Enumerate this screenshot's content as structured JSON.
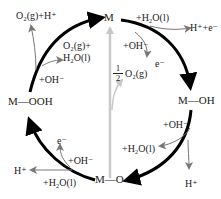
{
  "nodes": {
    "m": "M",
    "m_oh": "M—OH",
    "m_o": "M—O",
    "m_ooh": "M—OOH"
  },
  "center": {
    "fraction_num": "1",
    "fraction_den": "2",
    "species": "O₂(g)"
  },
  "steps": {
    "top_right": {
      "reactant_1": "+H₂O(l)",
      "reactant_2": "+OH⁻",
      "product_1": "H⁺+e⁻",
      "product_2": "e⁻"
    },
    "right": {
      "reactant_1": "+OH⁻",
      "reactant_2": "+H₂O(l)",
      "product_1": "H⁺"
    },
    "bottom_left": {
      "reactant_1": "+OH⁻",
      "reactant_2": "+H₂O(l)",
      "product_1": "e⁻",
      "product_2": "H⁺"
    },
    "top_left": {
      "reactant_1": "+OH⁻",
      "product_1": "O₂(g)+",
      "product_1b": "H₂O(l)",
      "product_2": "O₂(g)+H⁺"
    }
  },
  "colors": {
    "main_arrow": "#000000",
    "side_arrow": "#777777",
    "center_arrow": "#c8c8c8",
    "text": "#222222"
  }
}
